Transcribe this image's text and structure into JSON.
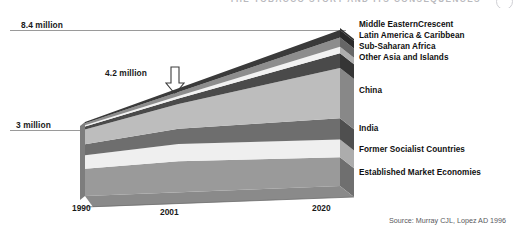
{
  "header": {
    "running_title": "THE TOBACCO STORY AND ITS CONSEQUENCES",
    "page_number": ""
  },
  "axis": {
    "y_top_label": "8.4 million",
    "y_bottom_label": "3 million",
    "annotation_label": "4.2 million",
    "annotation_icon": "arrow-down-icon",
    "x_labels": [
      "1990",
      "2001",
      "2020"
    ]
  },
  "legend": {
    "items": [
      {
        "label": "Middle EasternCrescent",
        "color": "#3a3a3a",
        "top": 6
      },
      {
        "label": "Latin America & Caribbean",
        "color": "#8d8d8d",
        "top": 17
      },
      {
        "label": "Sub-Saharan Africa",
        "color": "#f2f2f2",
        "top": 28
      },
      {
        "label": "Other Asia and Islands",
        "color": "#4a4a4a",
        "top": 39
      },
      {
        "label": "China",
        "color": "#bdbdbd",
        "top": 72
      },
      {
        "label": "India",
        "color": "#6e6e6e",
        "top": 110
      },
      {
        "label": "Former Socialist Countries",
        "color": "#efefef",
        "top": 131
      },
      {
        "label": "Established Market Economies",
        "color": "#9a9a9a",
        "top": 154
      }
    ]
  },
  "source": {
    "text": "Source: Murray CJL, Lopez AD 1996"
  },
  "chart_data": {
    "type": "area",
    "title": "",
    "subtitle": "",
    "xlabel": "",
    "ylabel": "",
    "x": [
      1990,
      2001,
      2020
    ],
    "ylim": [
      0,
      8.4
    ],
    "grid": false,
    "legend_position": "right",
    "units": "millions of tobacco-attributable deaths per year",
    "annotations": [
      {
        "text": "8.4 million",
        "at_y": 8.4
      },
      {
        "text": "3 million",
        "at_y": 3.0
      },
      {
        "text": "4.2 million",
        "at_y": 4.2
      }
    ],
    "totals": [
      3.0,
      4.2,
      8.4
    ],
    "series": [
      {
        "name": "Established Market Economies",
        "values": [
          1.1,
          1.25,
          1.55
        ],
        "color": "#9a9a9a"
      },
      {
        "name": "Former Socialist Countries",
        "values": [
          0.55,
          0.7,
          0.95
        ],
        "color": "#efefef"
      },
      {
        "name": "India",
        "values": [
          0.45,
          0.62,
          1.15
        ],
        "color": "#6e6e6e"
      },
      {
        "name": "China",
        "values": [
          0.6,
          1.0,
          2.7
        ],
        "color": "#bdbdbd"
      },
      {
        "name": "Other Asia and Islands",
        "values": [
          0.12,
          0.22,
          0.8
        ],
        "color": "#4a4a4a"
      },
      {
        "name": "Sub-Saharan Africa",
        "values": [
          0.05,
          0.1,
          0.35
        ],
        "color": "#f2f2f2"
      },
      {
        "name": "Latin America & Caribbean",
        "values": [
          0.08,
          0.16,
          0.5
        ],
        "color": "#8d8d8d"
      },
      {
        "name": "Middle EasternCrescent",
        "values": [
          0.05,
          0.15,
          0.4
        ],
        "color": "#3a3a3a"
      }
    ]
  }
}
